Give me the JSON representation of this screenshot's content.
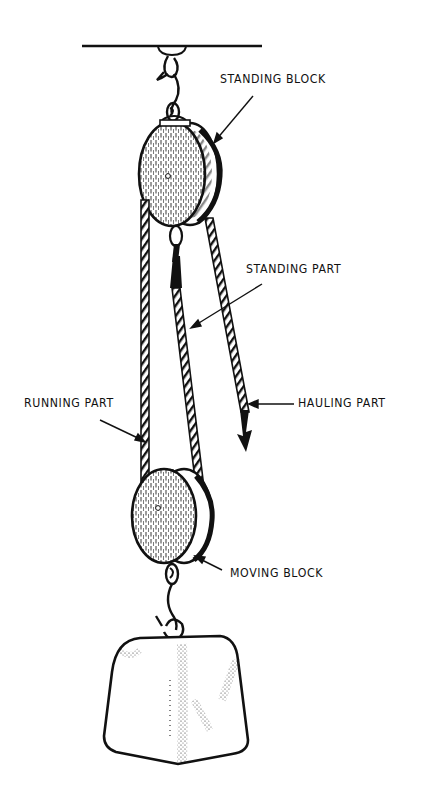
{
  "diagram": {
    "type": "block-and-tackle illustration",
    "colors": {
      "ink": "#111111",
      "background": "#ffffff"
    },
    "labels": {
      "standing_block": "STANDING BLOCK",
      "standing_part": "STANDING PART",
      "running_part": "RUNNING PART",
      "hauling_part": "HAULING PART",
      "moving_block": "MOVING BLOCK"
    },
    "components": [
      {
        "id": "ceiling-beam",
        "name": "overhead support line"
      },
      {
        "id": "top-hook",
        "name": "suspension hook and shackle"
      },
      {
        "id": "standing-block",
        "name": "upper pulley block"
      },
      {
        "id": "standing-part-rope",
        "name": "rope from standing block to moving block"
      },
      {
        "id": "running-part-rope",
        "name": "rope on left side"
      },
      {
        "id": "hauling-part-rope",
        "name": "rope with downward arrow"
      },
      {
        "id": "moving-block",
        "name": "lower pulley block"
      },
      {
        "id": "bottom-hook",
        "name": "hook holding weight"
      },
      {
        "id": "weight",
        "name": "load block"
      }
    ]
  }
}
